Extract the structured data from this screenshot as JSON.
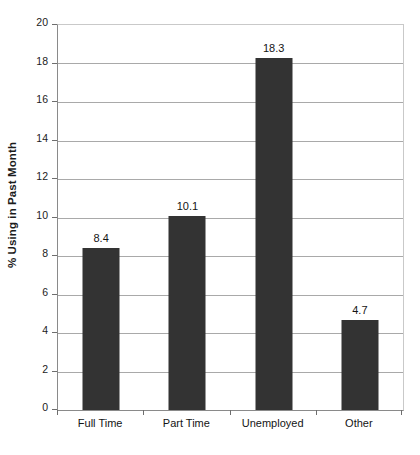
{
  "chart_data": {
    "type": "bar",
    "title": "",
    "subtitle": "",
    "xlabel": "",
    "ylabel": "% Using in Past Month",
    "categories": [
      "Full Time",
      "Part Time",
      "Unemployed",
      "Other"
    ],
    "values": [
      8.4,
      10.1,
      18.3,
      4.7
    ],
    "data_labels": [
      "8.4",
      "10.1",
      "18.3",
      "4.7"
    ],
    "ylim": [
      0,
      20
    ],
    "ytick_step": 2,
    "ytick_labels": [
      "0",
      "2",
      "4",
      "6",
      "8",
      "10",
      "12",
      "14",
      "16",
      "18",
      "20"
    ],
    "ytick_values": [
      0,
      2,
      4,
      6,
      8,
      10,
      12,
      14,
      16,
      18,
      20
    ],
    "grid": true,
    "grid_axis": "y",
    "legend": false,
    "legend_position": "none",
    "bar_color": "#333333",
    "grid_color": "#a9a9a9",
    "axis_color": "#8a8a8a",
    "background_color": "#ffffff",
    "text_color": "#141414"
  }
}
